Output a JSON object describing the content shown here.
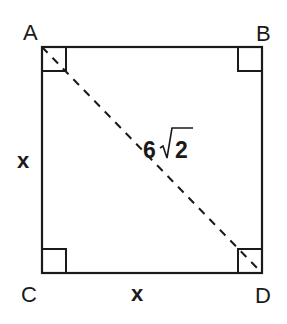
{
  "diagram": {
    "type": "square-with-diagonal",
    "vertices": {
      "A": {
        "label": "A",
        "position": "top-left"
      },
      "B": {
        "label": "B",
        "position": "top-right"
      },
      "C": {
        "label": "C",
        "position": "bottom-left"
      },
      "D": {
        "label": "D",
        "position": "bottom-right"
      }
    },
    "sides": {
      "left": {
        "label": "x",
        "between": "A-C"
      },
      "bottom": {
        "label": "x",
        "between": "C-D"
      }
    },
    "diagonal": {
      "between": "A-D",
      "style": "dashed",
      "coefficient": "6",
      "radicand": "2",
      "label_text": "6√2"
    },
    "right_angles": [
      "A",
      "B",
      "C",
      "D"
    ],
    "colors": {
      "stroke": "#1a1a1a",
      "background": "#ffffff"
    }
  }
}
